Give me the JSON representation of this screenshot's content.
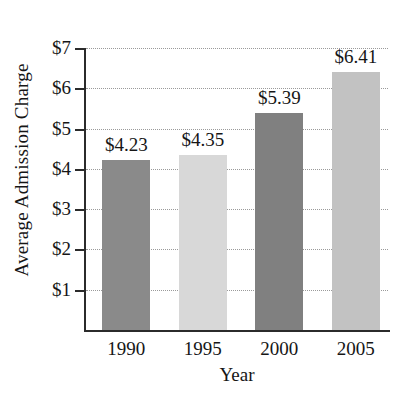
{
  "chart_data": {
    "type": "bar",
    "title": "",
    "xlabel": "Year",
    "ylabel": "Average Admission Charge",
    "categories": [
      "1990",
      "1995",
      "2000",
      "2005"
    ],
    "values": [
      4.23,
      4.35,
      5.39,
      6.41
    ],
    "data_labels": [
      "$4.23",
      "$4.35",
      "$5.39",
      "$6.41"
    ],
    "bar_colors": [
      "#8a8a8a",
      "#d8d8d8",
      "#808080",
      "#c2c2c2"
    ],
    "ylim": [
      0,
      7
    ],
    "ytick_values": [
      1,
      2,
      3,
      4,
      5,
      6,
      7
    ],
    "ytick_labels": [
      "$1",
      "$2",
      "$3",
      "$4",
      "$5",
      "$6",
      "$7"
    ],
    "grid": true,
    "grid_style": "dotted",
    "grid_axis": "y",
    "legend": false,
    "legend_position": "none",
    "axis_color": "#2b2b2b",
    "grid_color": "#9a9a9a",
    "background_color": "#ffffff"
  }
}
